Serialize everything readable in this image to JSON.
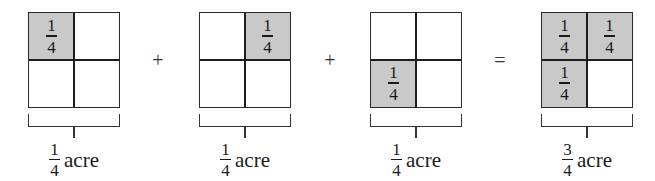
{
  "diagram": {
    "shade_color": "#c9c9c9",
    "line_color": "#1e1e1e",
    "operators": [
      "+",
      "+",
      "="
    ],
    "unit": "acre",
    "panels": [
      {
        "shaded_cells": [
          "top-left"
        ],
        "cell_labels": {
          "tl": {
            "num": "1",
            "den": "4"
          }
        },
        "total": {
          "num": "1",
          "den": "4",
          "unit": "acre"
        }
      },
      {
        "shaded_cells": [
          "top-right"
        ],
        "cell_labels": {
          "tr": {
            "num": "1",
            "den": "4"
          }
        },
        "total": {
          "num": "1",
          "den": "4",
          "unit": "acre"
        }
      },
      {
        "shaded_cells": [
          "bottom-left"
        ],
        "cell_labels": {
          "bl": {
            "num": "1",
            "den": "4"
          }
        },
        "total": {
          "num": "1",
          "den": "4",
          "unit": "acre"
        }
      },
      {
        "shaded_cells": [
          "top-left",
          "top-right",
          "bottom-left"
        ],
        "cell_labels": {
          "tl": {
            "num": "1",
            "den": "4"
          },
          "tr": {
            "num": "1",
            "den": "4"
          },
          "bl": {
            "num": "1",
            "den": "4"
          }
        },
        "total": {
          "num": "3",
          "den": "4",
          "unit": "acre"
        }
      }
    ]
  }
}
